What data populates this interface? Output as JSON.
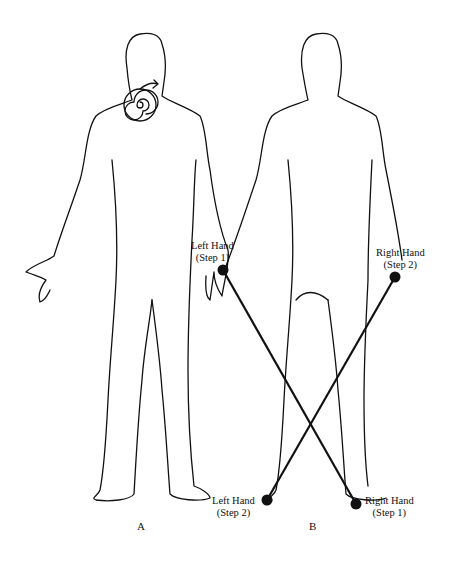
{
  "figures": {
    "A": {
      "label": "A"
    },
    "B": {
      "label": "B"
    }
  },
  "labels": {
    "left_hand_step1": {
      "line1": "Left Hand",
      "line2": "(Step 1)"
    },
    "right_hand_step2": {
      "line1": "Right Hand",
      "line2": "(Step 2)"
    },
    "left_hand_step2": {
      "line1": "Left Hand",
      "line2": "(Step 2)"
    },
    "right_hand_step1": {
      "line1": "Right Hand",
      "line2": "(Step 1)"
    }
  },
  "colors": {
    "line": "#111111",
    "background": "#ffffff"
  }
}
